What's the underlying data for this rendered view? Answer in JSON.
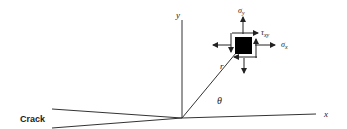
{
  "diagram": {
    "title": "",
    "labels": {
      "crack": "Crack",
      "x_axis": "x",
      "y_axis": "y",
      "radius": "r",
      "angle": "θ",
      "sigma_y": "σ",
      "sigma_y_sub": "y",
      "sigma_x": "σ",
      "sigma_x_sub": "x",
      "tau_xy": "τ",
      "tau_xy_sub": "xy"
    },
    "colors": {
      "line": "#333333",
      "element": "#000000"
    }
  }
}
